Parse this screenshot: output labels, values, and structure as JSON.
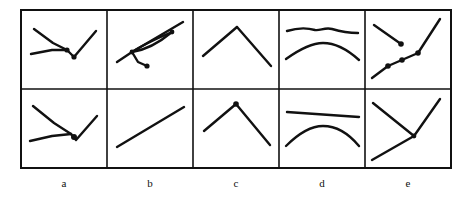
{
  "figure": {
    "type": "line-sketch-grid",
    "rows": 2,
    "columns": 5,
    "stroke_color": "#111111",
    "border_color": "#111111",
    "background_color": "#ffffff",
    "grid": {
      "left": 21,
      "top": 10,
      "right": 451,
      "bottom": 168,
      "middle_y": 89,
      "column_dividers": [
        107,
        193,
        279,
        365
      ],
      "border_width": 2.0,
      "divider_width": 1.6
    },
    "column_labels": [
      {
        "text": "a",
        "center_x": 64,
        "y": 177
      },
      {
        "text": "b",
        "center_x": 150,
        "y": 177
      },
      {
        "text": "c",
        "center_x": 236,
        "y": 177
      },
      {
        "text": "d",
        "center_x": 322,
        "y": 177
      },
      {
        "text": "e",
        "center_x": 408,
        "y": 177
      }
    ],
    "cells": [
      {
        "id": "a-top",
        "row": "top",
        "column": "a",
        "content": "two converging strokes meeting at a dot then a V vertex with a dot and an ascending stroke",
        "strokes": [
          {
            "name": "descending-stroke",
            "kind": "polyline",
            "points": "34,29 53,43 67,50"
          },
          {
            "name": "ascending-stroke",
            "kind": "polyline",
            "points": "31,54 52,50 67,50"
          },
          {
            "name": "v-right-stroke",
            "kind": "polyline",
            "points": "67,50 74,57 96,31"
          },
          {
            "name": "junction-dot",
            "kind": "dot",
            "cx": 67,
            "cy": 50,
            "r": 2.6
          },
          {
            "name": "vertex-dot",
            "kind": "dot",
            "cx": 74,
            "cy": 57,
            "r": 2.6
          }
        ]
      },
      {
        "id": "b-top",
        "row": "top",
        "column": "b",
        "content": "ascending diagonal with a narrow lens shape along it and a short lower branch ending in a dot",
        "strokes": [
          {
            "name": "main-diagonal",
            "kind": "polyline",
            "points": "117,62 132,52 183,22"
          },
          {
            "name": "lens-upper-curve",
            "kind": "path",
            "d": "M132,52 C144,44 158,38 172,32"
          },
          {
            "name": "lens-lower-curve",
            "kind": "path",
            "d": "M132,52 C146,50 160,42 172,32"
          },
          {
            "name": "branch-stroke",
            "kind": "polyline",
            "points": "132,52 138,62 147,66"
          },
          {
            "name": "branch-dot",
            "kind": "dot",
            "cx": 147,
            "cy": 66,
            "r": 2.6
          },
          {
            "name": "lens-left-dot",
            "kind": "dot",
            "cx": 132,
            "cy": 52,
            "r": 2.4
          },
          {
            "name": "lens-right-dot",
            "kind": "dot",
            "cx": 172,
            "cy": 32,
            "r": 2.4
          }
        ]
      },
      {
        "id": "c-top",
        "row": "top",
        "column": "c",
        "content": "inverted V peak: rising stroke then falling stroke",
        "strokes": [
          {
            "name": "rising-stroke",
            "kind": "polyline",
            "points": "203,56 237,27"
          },
          {
            "name": "falling-stroke",
            "kind": "polyline",
            "points": "237,27 271,66"
          }
        ]
      },
      {
        "id": "d-top",
        "row": "top",
        "column": "d",
        "content": "nearly flat wavy line above a shallow dome arc",
        "strokes": [
          {
            "name": "flat-wavy-line",
            "kind": "path",
            "d": "M287,31 C300,27 308,28 315,30 C320,31 325,27 332,29 C342,32 352,33 358,33"
          },
          {
            "name": "dome-arc",
            "kind": "path",
            "d": "M286,59 C300,49 312,43 323,43 C336,43 348,50 359,60"
          }
        ]
      },
      {
        "id": "e-top",
        "row": "top",
        "column": "e",
        "content": "short descending stroke with end dot, plus an ascending dotted zigzag path",
        "strokes": [
          {
            "name": "upper-descending-stroke",
            "kind": "polyline",
            "points": "374,25 401,44"
          },
          {
            "name": "upper-stroke-dot",
            "kind": "dot",
            "cx": 401,
            "cy": 44,
            "r": 2.8
          },
          {
            "name": "zigzag-lower-stroke",
            "kind": "polyline",
            "points": "372,78 388,66"
          },
          {
            "name": "zigzag-mid-stroke",
            "kind": "polyline",
            "points": "388,66 418,53"
          },
          {
            "name": "zigzag-upper-stroke",
            "kind": "polyline",
            "points": "418,53 440,19"
          },
          {
            "name": "zigzag-dot-1",
            "kind": "dot",
            "cx": 388,
            "cy": 66,
            "r": 2.8
          },
          {
            "name": "zigzag-dot-2",
            "kind": "dot",
            "cx": 402,
            "cy": 60,
            "r": 2.8
          },
          {
            "name": "zigzag-dot-3",
            "kind": "dot",
            "cx": 418,
            "cy": 53,
            "r": 2.8
          }
        ]
      },
      {
        "id": "a-bottom",
        "row": "bottom",
        "column": "a",
        "content": "two converging strokes meeting at a thick vertex then an ascending stroke",
        "strokes": [
          {
            "name": "descending-stroke",
            "kind": "polyline",
            "points": "33,106 54,123 71,134"
          },
          {
            "name": "ascending-stroke",
            "kind": "polyline",
            "points": "30,141 52,136 71,134"
          },
          {
            "name": "v-right-stroke",
            "kind": "polyline",
            "points": "71,134 76,140 97,116"
          },
          {
            "name": "vertex-dot",
            "kind": "dot",
            "cx": 74,
            "cy": 137,
            "r": 3.0
          }
        ]
      },
      {
        "id": "b-bottom",
        "row": "bottom",
        "column": "b",
        "content": "single straight ascending diagonal line",
        "strokes": [
          {
            "name": "ascending-line",
            "kind": "polyline",
            "points": "117,147 184,107"
          }
        ]
      },
      {
        "id": "c-bottom",
        "row": "bottom",
        "column": "c",
        "content": "inverted V peak with a dot at the apex",
        "strokes": [
          {
            "name": "rising-stroke",
            "kind": "polyline",
            "points": "204,131 236,104"
          },
          {
            "name": "falling-stroke",
            "kind": "polyline",
            "points": "236,104 270,145"
          },
          {
            "name": "apex-dot",
            "kind": "dot",
            "cx": 236,
            "cy": 104,
            "r": 2.8
          }
        ]
      },
      {
        "id": "d-bottom",
        "row": "bottom",
        "column": "d",
        "content": "straight slightly tilted line above a shallow dome arc",
        "strokes": [
          {
            "name": "tilted-line",
            "kind": "polyline",
            "points": "287,112 359,117"
          },
          {
            "name": "dome-arc",
            "kind": "path",
            "d": "M286,146 C300,132 312,126 323,126 C337,126 349,134 359,146"
          }
        ]
      },
      {
        "id": "e-bottom",
        "row": "bottom",
        "column": "e",
        "content": "two strokes converging to a point on the right with an ascending stroke to the upper right",
        "strokes": [
          {
            "name": "upper-descending-stroke",
            "kind": "polyline",
            "points": "373,103 414,136"
          },
          {
            "name": "lower-ascending-stroke",
            "kind": "polyline",
            "points": "372,160 414,136"
          },
          {
            "name": "rising-stroke",
            "kind": "polyline",
            "points": "414,136 440,99"
          },
          {
            "name": "vertex-dot",
            "kind": "dot",
            "cx": 414,
            "cy": 136,
            "r": 2.4
          }
        ]
      }
    ]
  }
}
